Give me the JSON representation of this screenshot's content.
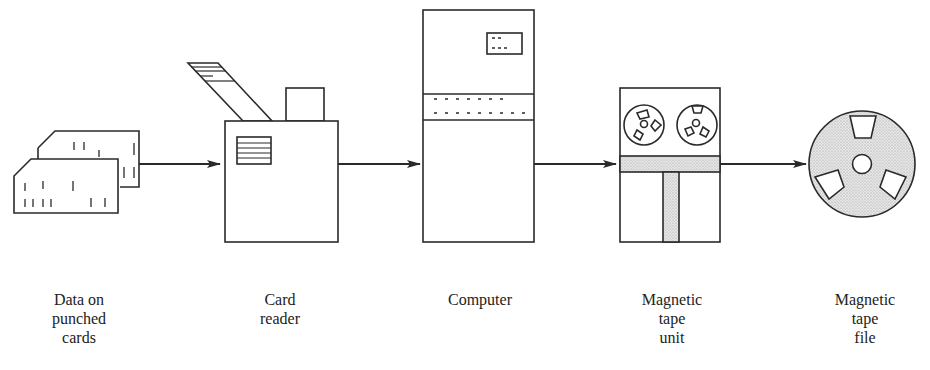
{
  "diagram": {
    "type": "data-flow",
    "stroke_color": "#2a2a2a",
    "shade_color": "#d8d8d8",
    "nodes": [
      {
        "id": "punched-cards",
        "lines": [
          "Data on",
          "punched",
          "cards"
        ]
      },
      {
        "id": "card-reader",
        "lines": [
          "Card",
          "reader"
        ]
      },
      {
        "id": "computer",
        "lines": [
          "Computer"
        ]
      },
      {
        "id": "tape-unit",
        "lines": [
          "Magnetic",
          "tape",
          "unit"
        ]
      },
      {
        "id": "tape-file",
        "lines": [
          "Magnetic",
          "tape",
          "file"
        ]
      }
    ],
    "edges": [
      {
        "from": "punched-cards",
        "to": "card-reader"
      },
      {
        "from": "card-reader",
        "to": "computer"
      },
      {
        "from": "computer",
        "to": "tape-unit"
      },
      {
        "from": "tape-unit",
        "to": "tape-file"
      }
    ]
  }
}
